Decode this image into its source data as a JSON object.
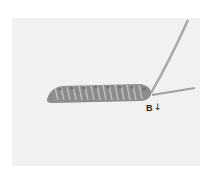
{
  "image": {
    "description": "Embroidery stitch demonstration: a padded row of looped stitches on fabric with working thread emerging at right",
    "label": "B",
    "arrow": "↓",
    "colors": {
      "background": "#ffffff",
      "fabric": "#f1f1f1",
      "thread": "#9a9a9a",
      "thread_dark": "#6e6e6e"
    }
  }
}
